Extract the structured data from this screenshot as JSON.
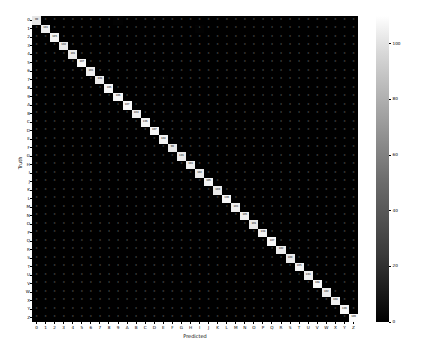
{
  "chart_data": {
    "type": "heatmap",
    "title": "",
    "xlabel": "Predicted",
    "ylabel": "Truth",
    "grid": false,
    "legend_position": "right-colorbar",
    "colormap": "gray",
    "colorbar": {
      "label": "",
      "ticks": [
        0,
        20,
        40,
        60,
        80,
        100
      ],
      "vmin": 0,
      "vmax": 110
    },
    "categories": [
      "0",
      "1",
      "2",
      "3",
      "4",
      "5",
      "6",
      "7",
      "8",
      "9",
      "A",
      "B",
      "C",
      "D",
      "E",
      "F",
      "G",
      "H",
      "I",
      "J",
      "K",
      "L",
      "M",
      "N",
      "O",
      "P",
      "Q",
      "R",
      "S",
      "T",
      "U",
      "V",
      "W",
      "X",
      "Y",
      "Z"
    ],
    "x": [
      "0",
      "1",
      "2",
      "3",
      "4",
      "5",
      "6",
      "7",
      "8",
      "9",
      "A",
      "B",
      "C",
      "D",
      "E",
      "F",
      "G",
      "H",
      "I",
      "J",
      "K",
      "L",
      "M",
      "N",
      "O",
      "P",
      "Q",
      "R",
      "S",
      "T",
      "U",
      "V",
      "W",
      "X",
      "Y",
      "Z"
    ],
    "y": [
      "0",
      "1",
      "2",
      "3",
      "4",
      "5",
      "6",
      "7",
      "8",
      "9",
      "A",
      "B",
      "C",
      "D",
      "E",
      "F",
      "G",
      "H",
      "I",
      "J",
      "K",
      "L",
      "M",
      "N",
      "O",
      "P",
      "Q",
      "R",
      "S",
      "T",
      "U",
      "V",
      "W",
      "X",
      "Y",
      "Z"
    ],
    "values": [
      [
        99,
        0,
        0,
        0,
        0,
        0,
        0,
        0,
        0,
        1,
        0,
        0,
        0,
        0,
        0,
        0,
        0,
        0,
        0,
        0,
        0,
        0,
        0,
        0,
        0,
        0,
        0,
        0,
        0,
        0,
        0,
        0,
        0,
        0,
        0,
        0
      ],
      [
        0,
        103,
        0,
        0,
        0,
        0,
        0,
        0,
        0,
        0,
        0,
        0,
        0,
        0,
        0,
        0,
        0,
        0,
        1,
        0,
        0,
        0,
        0,
        0,
        0,
        0,
        0,
        0,
        0,
        0,
        0,
        0,
        0,
        0,
        0,
        0
      ],
      [
        0,
        0,
        105,
        0,
        0,
        0,
        0,
        0,
        0,
        0,
        0,
        0,
        0,
        0,
        0,
        0,
        0,
        0,
        0,
        0,
        0,
        0,
        0,
        0,
        0,
        0,
        0,
        0,
        0,
        0,
        0,
        0,
        0,
        0,
        0,
        0
      ],
      [
        0,
        0,
        0,
        102,
        0,
        0,
        0,
        0,
        0,
        0,
        0,
        0,
        0,
        0,
        0,
        0,
        0,
        0,
        0,
        0,
        0,
        0,
        0,
        0,
        0,
        0,
        0,
        0,
        0,
        0,
        0,
        0,
        0,
        0,
        0,
        0
      ],
      [
        0,
        0,
        0,
        0,
        101,
        0,
        0,
        0,
        0,
        0,
        0,
        0,
        0,
        0,
        0,
        0,
        0,
        0,
        0,
        0,
        0,
        0,
        0,
        0,
        0,
        0,
        0,
        0,
        0,
        0,
        0,
        0,
        0,
        0,
        0,
        0
      ],
      [
        0,
        0,
        0,
        0,
        0,
        107,
        0,
        0,
        0,
        0,
        0,
        0,
        0,
        0,
        0,
        0,
        0,
        0,
        0,
        0,
        0,
        0,
        0,
        0,
        0,
        0,
        0,
        0,
        0,
        0,
        0,
        0,
        0,
        0,
        0,
        0
      ],
      [
        0,
        0,
        0,
        0,
        0,
        0,
        103,
        0,
        0,
        0,
        0,
        0,
        0,
        0,
        0,
        0,
        0,
        0,
        0,
        0,
        0,
        0,
        0,
        0,
        0,
        0,
        0,
        0,
        0,
        0,
        0,
        0,
        0,
        0,
        0,
        0
      ],
      [
        0,
        0,
        0,
        0,
        0,
        0,
        0,
        101,
        0,
        0,
        0,
        0,
        0,
        0,
        1,
        0,
        0,
        0,
        0,
        0,
        0,
        0,
        0,
        0,
        0,
        0,
        0,
        0,
        0,
        0,
        0,
        0,
        0,
        0,
        0,
        0
      ],
      [
        0,
        0,
        0,
        0,
        0,
        0,
        0,
        0,
        106,
        0,
        0,
        0,
        0,
        0,
        0,
        0,
        0,
        0,
        0,
        0,
        0,
        0,
        0,
        0,
        0,
        0,
        0,
        0,
        0,
        0,
        0,
        0,
        0,
        0,
        0,
        0
      ],
      [
        0,
        0,
        0,
        0,
        0,
        0,
        0,
        0,
        0,
        106,
        0,
        0,
        0,
        0,
        0,
        0,
        0,
        0,
        0,
        0,
        0,
        0,
        0,
        0,
        0,
        0,
        0,
        0,
        0,
        0,
        0,
        0,
        0,
        0,
        0,
        0
      ],
      [
        0,
        0,
        0,
        0,
        0,
        0,
        0,
        0,
        0,
        0,
        107,
        0,
        0,
        0,
        0,
        0,
        0,
        0,
        0,
        0,
        0,
        0,
        0,
        0,
        0,
        0,
        0,
        0,
        0,
        0,
        0,
        0,
        0,
        0,
        0,
        0
      ],
      [
        0,
        0,
        0,
        0,
        0,
        0,
        0,
        0,
        0,
        0,
        0,
        104,
        0,
        0,
        0,
        0,
        0,
        0,
        0,
        0,
        0,
        0,
        0,
        0,
        0,
        0,
        0,
        0,
        0,
        0,
        0,
        0,
        0,
        0,
        0,
        0
      ],
      [
        0,
        0,
        0,
        0,
        0,
        0,
        0,
        0,
        0,
        0,
        0,
        0,
        106,
        0,
        0,
        0,
        0,
        0,
        0,
        0,
        0,
        0,
        0,
        0,
        0,
        0,
        0,
        0,
        0,
        0,
        0,
        0,
        0,
        0,
        0,
        0
      ],
      [
        0,
        0,
        0,
        0,
        0,
        0,
        0,
        0,
        0,
        0,
        0,
        0,
        0,
        107,
        0,
        0,
        0,
        0,
        0,
        0,
        0,
        0,
        0,
        0,
        0,
        0,
        0,
        0,
        0,
        0,
        0,
        0,
        0,
        0,
        0,
        0
      ],
      [
        0,
        0,
        0,
        0,
        0,
        0,
        0,
        0,
        0,
        0,
        0,
        0,
        0,
        0,
        104,
        0,
        0,
        0,
        0,
        0,
        0,
        0,
        0,
        0,
        0,
        0,
        0,
        0,
        0,
        0,
        0,
        0,
        0,
        0,
        0,
        0
      ],
      [
        0,
        0,
        0,
        0,
        0,
        0,
        0,
        0,
        0,
        0,
        0,
        0,
        0,
        0,
        0,
        99,
        0,
        0,
        0,
        0,
        0,
        0,
        0,
        0,
        0,
        0,
        0,
        0,
        0,
        0,
        0,
        0,
        0,
        0,
        0,
        0
      ],
      [
        0,
        0,
        0,
        0,
        0,
        0,
        0,
        0,
        0,
        0,
        0,
        0,
        0,
        0,
        0,
        0,
        101,
        0,
        0,
        0,
        0,
        0,
        0,
        0,
        0,
        0,
        0,
        0,
        0,
        0,
        0,
        0,
        0,
        0,
        0,
        0
      ],
      [
        0,
        0,
        0,
        0,
        0,
        0,
        0,
        0,
        0,
        0,
        0,
        0,
        0,
        0,
        0,
        0,
        0,
        103,
        0,
        0,
        0,
        0,
        0,
        0,
        0,
        0,
        0,
        0,
        0,
        0,
        0,
        0,
        0,
        0,
        0,
        0
      ],
      [
        0,
        0,
        0,
        0,
        0,
        0,
        0,
        0,
        0,
        0,
        0,
        0,
        0,
        0,
        0,
        0,
        0,
        0,
        102,
        0,
        0,
        0,
        0,
        0,
        0,
        0,
        0,
        0,
        0,
        0,
        0,
        0,
        0,
        0,
        0,
        0
      ],
      [
        0,
        0,
        0,
        0,
        0,
        0,
        0,
        0,
        0,
        0,
        0,
        0,
        0,
        0,
        0,
        0,
        0,
        0,
        0,
        105,
        0,
        0,
        0,
        0,
        0,
        0,
        0,
        0,
        0,
        0,
        0,
        0,
        0,
        0,
        0,
        0
      ],
      [
        0,
        0,
        0,
        0,
        0,
        0,
        0,
        0,
        0,
        0,
        0,
        0,
        0,
        0,
        0,
        0,
        0,
        0,
        0,
        0,
        100,
        0,
        0,
        0,
        0,
        0,
        0,
        0,
        0,
        0,
        0,
        0,
        0,
        0,
        0,
        0
      ],
      [
        0,
        0,
        0,
        0,
        0,
        0,
        0,
        0,
        0,
        0,
        0,
        0,
        0,
        0,
        0,
        0,
        0,
        0,
        0,
        0,
        0,
        106,
        0,
        0,
        0,
        0,
        0,
        0,
        0,
        0,
        0,
        0,
        0,
        0,
        0,
        0
      ],
      [
        0,
        0,
        0,
        0,
        0,
        0,
        0,
        0,
        0,
        0,
        0,
        0,
        0,
        0,
        0,
        0,
        0,
        0,
        0,
        0,
        0,
        0,
        103,
        0,
        0,
        0,
        0,
        0,
        0,
        0,
        0,
        0,
        0,
        0,
        0,
        0
      ],
      [
        0,
        0,
        0,
        0,
        0,
        0,
        0,
        0,
        0,
        0,
        0,
        0,
        0,
        0,
        0,
        0,
        0,
        0,
        0,
        0,
        0,
        0,
        0,
        105,
        0,
        0,
        0,
        0,
        0,
        0,
        0,
        0,
        0,
        0,
        0,
        0
      ],
      [
        0,
        0,
        0,
        0,
        0,
        0,
        0,
        0,
        0,
        0,
        0,
        0,
        0,
        0,
        0,
        0,
        0,
        0,
        0,
        0,
        0,
        0,
        0,
        0,
        101,
        0,
        0,
        0,
        0,
        0,
        0,
        0,
        0,
        0,
        0,
        0
      ],
      [
        0,
        0,
        0,
        0,
        0,
        0,
        0,
        0,
        0,
        0,
        0,
        0,
        0,
        0,
        0,
        0,
        0,
        0,
        0,
        0,
        0,
        0,
        0,
        0,
        0,
        104,
        0,
        0,
        0,
        0,
        0,
        0,
        0,
        0,
        0,
        0
      ],
      [
        0,
        0,
        0,
        0,
        0,
        0,
        0,
        0,
        0,
        0,
        0,
        0,
        0,
        0,
        0,
        0,
        0,
        0,
        0,
        0,
        0,
        0,
        0,
        0,
        0,
        0,
        107,
        0,
        0,
        0,
        0,
        0,
        0,
        0,
        0,
        0
      ],
      [
        0,
        0,
        0,
        0,
        0,
        0,
        0,
        0,
        0,
        0,
        0,
        0,
        0,
        0,
        0,
        0,
        0,
        0,
        0,
        0,
        0,
        0,
        0,
        0,
        0,
        0,
        0,
        102,
        0,
        0,
        0,
        0,
        0,
        0,
        0,
        0
      ],
      [
        0,
        0,
        0,
        0,
        0,
        0,
        0,
        0,
        0,
        0,
        0,
        0,
        0,
        0,
        0,
        0,
        0,
        0,
        0,
        0,
        0,
        0,
        0,
        0,
        0,
        0,
        0,
        0,
        100,
        0,
        0,
        0,
        0,
        0,
        0,
        0
      ],
      [
        0,
        0,
        0,
        0,
        0,
        0,
        0,
        0,
        0,
        0,
        0,
        0,
        0,
        0,
        0,
        0,
        0,
        0,
        0,
        0,
        0,
        0,
        0,
        0,
        0,
        0,
        0,
        0,
        0,
        105,
        0,
        0,
        0,
        0,
        0,
        0
      ],
      [
        0,
        0,
        0,
        0,
        0,
        0,
        0,
        0,
        0,
        0,
        0,
        0,
        0,
        0,
        0,
        0,
        0,
        0,
        0,
        0,
        0,
        0,
        0,
        0,
        0,
        0,
        0,
        0,
        0,
        0,
        103,
        0,
        0,
        0,
        0,
        0
      ],
      [
        0,
        0,
        0,
        0,
        0,
        0,
        0,
        0,
        0,
        0,
        0,
        0,
        0,
        0,
        0,
        0,
        0,
        0,
        0,
        0,
        0,
        0,
        0,
        0,
        0,
        0,
        0,
        0,
        0,
        0,
        0,
        108,
        0,
        0,
        0,
        0
      ],
      [
        0,
        0,
        0,
        0,
        0,
        0,
        0,
        0,
        0,
        0,
        0,
        0,
        0,
        0,
        0,
        0,
        0,
        0,
        0,
        0,
        0,
        0,
        0,
        0,
        0,
        0,
        0,
        0,
        0,
        0,
        0,
        0,
        102,
        0,
        0,
        0
      ],
      [
        0,
        0,
        0,
        0,
        0,
        0,
        0,
        0,
        0,
        0,
        0,
        0,
        0,
        0,
        0,
        0,
        0,
        0,
        0,
        0,
        0,
        0,
        0,
        0,
        0,
        0,
        0,
        0,
        0,
        0,
        0,
        0,
        0,
        104,
        0,
        0
      ],
      [
        0,
        0,
        0,
        0,
        0,
        0,
        0,
        0,
        0,
        0,
        0,
        0,
        0,
        0,
        0,
        0,
        0,
        0,
        0,
        0,
        0,
        0,
        0,
        0,
        0,
        0,
        0,
        0,
        0,
        0,
        0,
        0,
        0,
        0,
        106,
        0
      ],
      [
        0,
        0,
        0,
        0,
        0,
        0,
        0,
        0,
        0,
        0,
        0,
        0,
        0,
        0,
        0,
        0,
        0,
        0,
        0,
        0,
        0,
        0,
        0,
        0,
        0,
        0,
        0,
        0,
        0,
        0,
        0,
        0,
        0,
        0,
        0,
        109
      ]
    ]
  }
}
